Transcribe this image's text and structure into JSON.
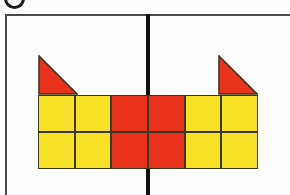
{
  "figure": {
    "badge": {
      "name": "question-number-badge",
      "label": ""
    },
    "symmetry_line": {
      "orientation": "vertical",
      "color": "#111111",
      "x": 148
    },
    "palette": {
      "yellow": "#f7e228",
      "red": "#e8321c",
      "outline": "#3a3a22",
      "frame": "#4a4a48",
      "background": "#fefefe"
    },
    "grid": {
      "columns": 6,
      "rows": 2,
      "cell_size": 37,
      "cells": [
        [
          "yellow",
          "yellow",
          "red",
          "red",
          "yellow",
          "yellow"
        ],
        [
          "yellow",
          "yellow",
          "red",
          "red",
          "yellow",
          "yellow"
        ]
      ]
    },
    "triangles": [
      {
        "name": "left-triangle",
        "color": "red",
        "column": 1,
        "orientation": "right-angle-bottom-left",
        "points": "0,0 0,40 40,40"
      },
      {
        "name": "right-triangle",
        "color": "red",
        "column": 6,
        "orientation": "right-angle-bottom-right",
        "points": "0,0 40,40 0,40"
      }
    ]
  }
}
